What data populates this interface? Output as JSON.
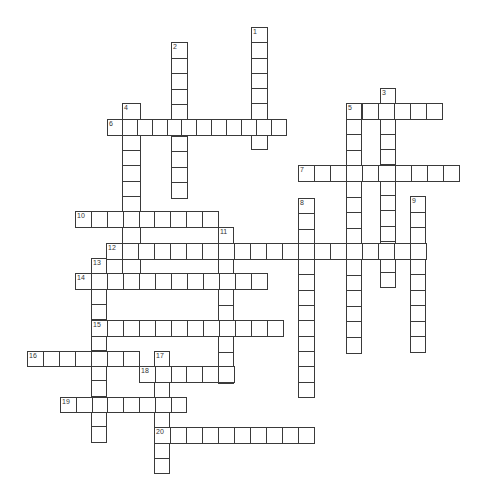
{
  "puzzle": {
    "type": "crossword",
    "colors": {
      "line": "#3a3a3a",
      "cell": "#ffffff",
      "number": "#333333"
    },
    "clues": [
      {
        "number": "1",
        "dir": "down",
        "x": 251,
        "y": 27,
        "len": 8,
        "cw": 17,
        "ch": 16.3
      },
      {
        "number": "2",
        "dir": "down",
        "x": 171,
        "y": 42,
        "len": 10,
        "cw": 17,
        "ch": 16.6
      },
      {
        "number": "3",
        "dir": "down",
        "x": 380,
        "y": 88,
        "len": 13,
        "cw": 16,
        "ch": 16.3
      },
      {
        "number": "4",
        "dir": "down",
        "x": 122,
        "y": 103,
        "len": 12,
        "cw": 19,
        "ch": 16.5
      },
      {
        "number": "5",
        "dir": "across",
        "x": 346,
        "y": 103,
        "len": 6,
        "cw": 17,
        "ch": 17
      },
      {
        "number": "5",
        "dir": "down",
        "x": 346,
        "y": 103,
        "len": 16,
        "cw": 16,
        "ch": 16.6
      },
      {
        "number": "6",
        "dir": "across",
        "x": 107,
        "y": 119,
        "len": 12,
        "cw": 15.9,
        "ch": 17
      },
      {
        "number": "7",
        "dir": "across",
        "x": 298,
        "y": 165,
        "len": 10,
        "cw": 17.1,
        "ch": 17
      },
      {
        "number": "8",
        "dir": "down",
        "x": 298,
        "y": 198,
        "len": 13,
        "cw": 17,
        "ch": 16.3
      },
      {
        "number": "9",
        "dir": "down",
        "x": 410,
        "y": 196,
        "len": 10,
        "cw": 16,
        "ch": 16.6
      },
      {
        "number": "10",
        "dir": "across",
        "x": 75,
        "y": 211,
        "len": 9,
        "cw": 16.9,
        "ch": 17
      },
      {
        "number": "11",
        "dir": "down",
        "x": 218,
        "y": 227,
        "len": 10,
        "cw": 16,
        "ch": 16.6
      },
      {
        "number": "12",
        "dir": "across",
        "x": 106,
        "y": 243,
        "len": 20,
        "cw": 17,
        "ch": 17
      },
      {
        "number": "13",
        "dir": "down",
        "x": 91,
        "y": 258,
        "len": 12,
        "cw": 16,
        "ch": 16.3
      },
      {
        "number": "14",
        "dir": "across",
        "x": 75,
        "y": 273,
        "len": 12,
        "cw": 17,
        "ch": 17
      },
      {
        "number": "15",
        "dir": "across",
        "x": 91,
        "y": 320,
        "len": 12,
        "cw": 17,
        "ch": 17
      },
      {
        "number": "16",
        "dir": "across",
        "x": 27,
        "y": 351,
        "len": 7,
        "cw": 17,
        "ch": 16
      },
      {
        "number": "17",
        "dir": "down",
        "x": 154,
        "y": 351,
        "len": 8,
        "cw": 16,
        "ch": 16.3
      },
      {
        "number": "18",
        "dir": "across",
        "x": 139,
        "y": 366,
        "len": 6,
        "cw": 16.8,
        "ch": 17
      },
      {
        "number": "19",
        "dir": "across",
        "x": 60,
        "y": 397,
        "len": 8,
        "cw": 16.8,
        "ch": 16
      },
      {
        "number": "20",
        "dir": "across",
        "x": 154,
        "y": 427,
        "len": 10,
        "cw": 17,
        "ch": 17
      }
    ]
  }
}
